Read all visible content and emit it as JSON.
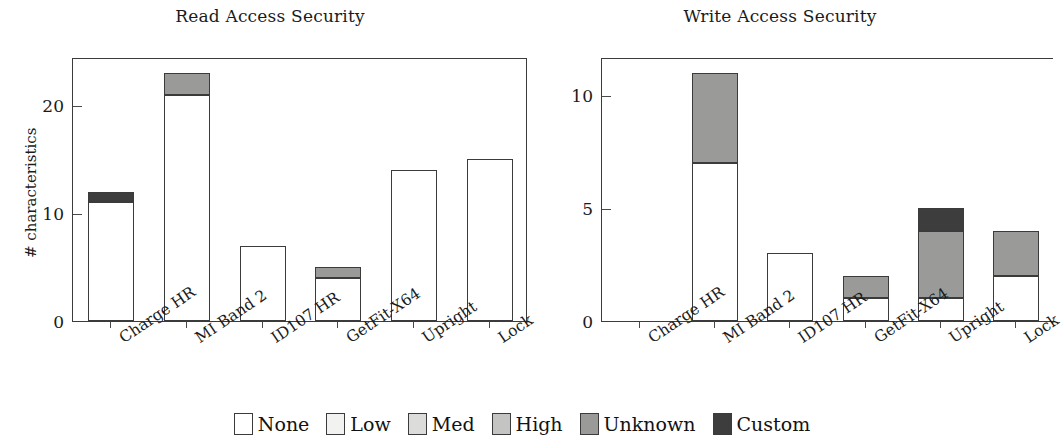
{
  "figure": {
    "legend": {
      "items": [
        {
          "label": "None",
          "color": "#ffffff"
        },
        {
          "label": "Low",
          "color": "#f2f2f0"
        },
        {
          "label": "Med",
          "color": "#dcdcda"
        },
        {
          "label": "High",
          "color": "#c4c4c2"
        },
        {
          "label": "Unknown",
          "color": "#9a9a98"
        },
        {
          "label": "Custom",
          "color": "#3d3d3d"
        }
      ]
    }
  },
  "chart_data": [
    {
      "type": "bar",
      "id": "read-access-security",
      "title": "Read Access Security",
      "xlabel": "",
      "ylabel": "# characteristics",
      "stacked": true,
      "grid": false,
      "legend_position": "bottom",
      "ylim": [
        0,
        24.5
      ],
      "yticks": [
        0,
        10,
        20
      ],
      "ytick_labels": [
        "0",
        "10",
        "20"
      ],
      "categories": [
        "Charge HR",
        "MI Band 2",
        "ID107 HR",
        "GetFit-X64",
        "Upright",
        "Lock"
      ],
      "series": [
        {
          "name": "None",
          "color": "#ffffff",
          "values": [
            11,
            21,
            7,
            4,
            14,
            15
          ]
        },
        {
          "name": "Low",
          "color": "#f2f2f0",
          "values": [
            0,
            0,
            0,
            0,
            0,
            0
          ]
        },
        {
          "name": "Med",
          "color": "#dcdcda",
          "values": [
            0,
            0,
            0,
            0,
            0,
            0
          ]
        },
        {
          "name": "High",
          "color": "#c4c4c2",
          "values": [
            0,
            0,
            0,
            0,
            0,
            0
          ]
        },
        {
          "name": "Unknown",
          "color": "#9a9a98",
          "values": [
            0,
            2,
            0,
            1,
            0,
            0
          ]
        },
        {
          "name": "Custom",
          "color": "#3d3d3d",
          "values": [
            1,
            0,
            0,
            0,
            0,
            0
          ]
        }
      ],
      "totals": [
        12,
        23,
        7,
        5,
        14,
        15
      ]
    },
    {
      "type": "bar",
      "id": "write-access-security",
      "title": "Write Access Security",
      "xlabel": "",
      "ylabel": "",
      "stacked": true,
      "grid": false,
      "legend_position": "bottom",
      "ylim": [
        0,
        11.7
      ],
      "yticks": [
        0,
        5,
        10
      ],
      "ytick_labels": [
        "0",
        "5",
        "10"
      ],
      "categories": [
        "Charge HR",
        "MI Band 2",
        "ID107 HR",
        "GetFit-X64",
        "Upright",
        "Lock"
      ],
      "series": [
        {
          "name": "None",
          "color": "#ffffff",
          "values": [
            0,
            7,
            3,
            1,
            1,
            2
          ]
        },
        {
          "name": "Low",
          "color": "#f2f2f0",
          "values": [
            0,
            0,
            0,
            0,
            0,
            0
          ]
        },
        {
          "name": "Med",
          "color": "#dcdcda",
          "values": [
            0,
            0,
            0,
            0,
            0,
            0
          ]
        },
        {
          "name": "High",
          "color": "#c4c4c2",
          "values": [
            0,
            0,
            0,
            0,
            0,
            0
          ]
        },
        {
          "name": "Unknown",
          "color": "#9a9a98",
          "values": [
            0,
            4,
            0,
            1,
            3,
            2
          ]
        },
        {
          "name": "Custom",
          "color": "#3d3d3d",
          "values": [
            0,
            0,
            0,
            0,
            1,
            0
          ]
        }
      ],
      "totals": [
        0,
        11,
        3,
        2,
        5,
        4
      ]
    }
  ]
}
